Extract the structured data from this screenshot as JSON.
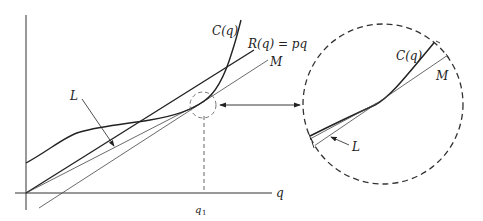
{
  "diagram": {
    "type": "economics-cost-revenue-tangency",
    "axes": {
      "x_label": "q",
      "x_tick_label": "q",
      "x_tick_subscript": "1"
    },
    "curves": {
      "cost": {
        "label": "C(q)"
      },
      "revenue": {
        "label": "R(q) = pq"
      },
      "line_m": {
        "label": "M"
      },
      "line_l": {
        "label": "L"
      }
    },
    "inset": {
      "cost_label": "C(q)",
      "m_label": "M",
      "l_label": "L"
    },
    "colors": {
      "stroke": "#222222",
      "thin_stroke": "#444444",
      "dashed": "#555555",
      "background": "#ffffff"
    }
  }
}
